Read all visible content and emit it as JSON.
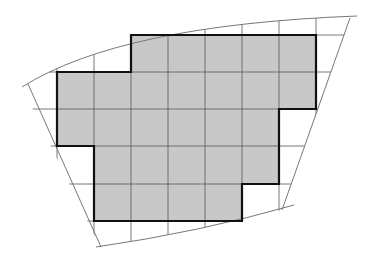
{
  "diagram": {
    "colors": {
      "fill": "#c8c8c8",
      "grid": "#555555",
      "outline": "#111111",
      "boundary": "#777777",
      "background": "#ffffff"
    },
    "grid": {
      "x": [
        57,
        94,
        131,
        168,
        205,
        242,
        279,
        316
      ],
      "y": [
        35,
        72,
        109,
        146,
        184,
        221
      ]
    },
    "shaded_cell_count": 27,
    "polygon_points": "131,35 316,35 316,109 279,109 279,184 242,184 242,221 94,221 94,146 57,146 57,72 131,72"
  }
}
